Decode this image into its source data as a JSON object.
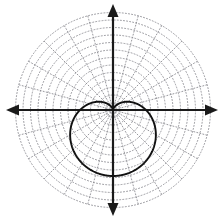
{
  "figure": {
    "background_color": "#ffffff",
    "width": 224,
    "height": 220
  },
  "chart_data": {
    "type": "line",
    "plot_style": "polar",
    "title": "",
    "subtitle": "",
    "xlabel": "",
    "ylabel": "",
    "grid": true,
    "legend": false,
    "legend_position": "none",
    "axes": {
      "x_axis_label": "",
      "y_axis_label": "",
      "origin_px": {
        "x": 113,
        "y": 110
      },
      "x_axis_y_px": 110,
      "y_axis_x_px": 113,
      "x_axis_color": "#1a1a1a",
      "y_axis_color": "#1a1a1a",
      "x_axis_arrowheads": "both",
      "y_axis_arrowheads": "both",
      "x_axis_extent_px": [
        6,
        218
      ],
      "y_axis_extent_px": [
        4,
        216
      ],
      "tick_labels_x": [],
      "tick_labels_y": []
    },
    "polar_grid": {
      "color": "#8d8d93",
      "line_style": "dotted",
      "circle_count": 13,
      "circle_radii_px": [
        7.5,
        15,
        22.5,
        30,
        37.5,
        45,
        52.5,
        60,
        67.5,
        75,
        82.5,
        90,
        97.5
      ],
      "radial_spoke_count": 24,
      "radial_spoke_spacing_deg": 15,
      "radial_spoke_angles_deg": [
        0,
        15,
        30,
        45,
        60,
        75,
        90,
        105,
        120,
        135,
        150,
        165,
        180,
        195,
        210,
        225,
        240,
        255,
        270,
        285,
        300,
        315,
        330,
        345
      ],
      "outer_radius_px": 97.5
    },
    "series": [
      {
        "name": "cardioid",
        "equation": "r = a(1 - sin θ)",
        "amplitude_a": 33,
        "orientation": "cusp at origin, opening downward",
        "color": "#111111",
        "line_width_px": 1.9,
        "fill": "none",
        "extents_px": {
          "left": 62,
          "right": 165,
          "top": 94,
          "bottom": 176
        },
        "key_points_polar": [
          {
            "theta_deg": 90,
            "r": 0
          },
          {
            "theta_deg": 45,
            "r": 9.7
          },
          {
            "theta_deg": 0,
            "r": 33
          },
          {
            "theta_deg": -45,
            "r": 56.3
          },
          {
            "theta_deg": -90,
            "r": 66
          },
          {
            "theta_deg": 180,
            "r": 33
          },
          {
            "theta_deg": 225,
            "r": 56.3
          }
        ]
      }
    ]
  }
}
